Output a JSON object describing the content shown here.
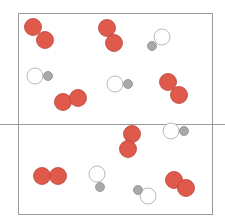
{
  "diagram": {
    "title": "",
    "box": {
      "x": 18,
      "y": 13,
      "w": 194,
      "h": 201,
      "stroke": "#9a9a9a"
    },
    "divider": {
      "x1": 0,
      "x2": 225,
      "y": 124,
      "stroke": "#9a9a9a"
    },
    "colors": {
      "red_atom_fill": "#e05a4b",
      "red_atom_stroke": "#b8443a",
      "white_atom_fill": "#ffffff",
      "white_atom_stroke": "#a8a8a8",
      "gray_atom_fill": "#a9a9a9",
      "gray_atom_stroke": "#8c8c8c"
    },
    "molecules": [
      {
        "type": "red-diatomic",
        "atoms": [
          {
            "cx": 33,
            "cy": 27,
            "r": 8.5
          },
          {
            "cx": 45,
            "cy": 40,
            "r": 8.5
          }
        ]
      },
      {
        "type": "red-diatomic",
        "atoms": [
          {
            "cx": 107,
            "cy": 28,
            "r": 8.5
          },
          {
            "cx": 114,
            "cy": 43,
            "r": 8.5
          }
        ]
      },
      {
        "type": "white-gray",
        "atoms": [
          {
            "cx": 162,
            "cy": 37,
            "r": 8,
            "kind": "white"
          },
          {
            "cx": 152,
            "cy": 46,
            "r": 4.5,
            "kind": "gray"
          }
        ]
      },
      {
        "type": "white-gray",
        "atoms": [
          {
            "cx": 35,
            "cy": 76,
            "r": 8,
            "kind": "white"
          },
          {
            "cx": 48,
            "cy": 76,
            "r": 4.5,
            "kind": "gray"
          }
        ]
      },
      {
        "type": "red-diatomic",
        "atoms": [
          {
            "cx": 63,
            "cy": 102,
            "r": 8.5
          },
          {
            "cx": 78,
            "cy": 98,
            "r": 8.5
          }
        ]
      },
      {
        "type": "white-gray",
        "atoms": [
          {
            "cx": 115,
            "cy": 84,
            "r": 8,
            "kind": "white"
          },
          {
            "cx": 128,
            "cy": 84,
            "r": 4.5,
            "kind": "gray"
          }
        ]
      },
      {
        "type": "red-diatomic",
        "atoms": [
          {
            "cx": 168,
            "cy": 82,
            "r": 8.5
          },
          {
            "cx": 179,
            "cy": 95,
            "r": 8.5
          }
        ]
      },
      {
        "type": "red-diatomic",
        "atoms": [
          {
            "cx": 132,
            "cy": 134,
            "r": 8.5
          },
          {
            "cx": 128,
            "cy": 149,
            "r": 8.5
          }
        ]
      },
      {
        "type": "white-gray",
        "atoms": [
          {
            "cx": 171,
            "cy": 131,
            "r": 8,
            "kind": "white"
          },
          {
            "cx": 184,
            "cy": 131,
            "r": 4.5,
            "kind": "gray"
          }
        ]
      },
      {
        "type": "red-diatomic",
        "atoms": [
          {
            "cx": 42,
            "cy": 176,
            "r": 8.5
          },
          {
            "cx": 58,
            "cy": 176,
            "r": 8.5
          }
        ]
      },
      {
        "type": "white-gray",
        "atoms": [
          {
            "cx": 97,
            "cy": 174,
            "r": 8,
            "kind": "white"
          },
          {
            "cx": 100,
            "cy": 187,
            "r": 4.5,
            "kind": "gray"
          }
        ]
      },
      {
        "type": "white-gray",
        "atoms": [
          {
            "cx": 148,
            "cy": 196,
            "r": 8,
            "kind": "white"
          },
          {
            "cx": 138,
            "cy": 190,
            "r": 4.5,
            "kind": "gray"
          }
        ]
      },
      {
        "type": "red-diatomic",
        "atoms": [
          {
            "cx": 174,
            "cy": 180,
            "r": 8.5
          },
          {
            "cx": 186,
            "cy": 188,
            "r": 8.5
          }
        ]
      }
    ]
  }
}
